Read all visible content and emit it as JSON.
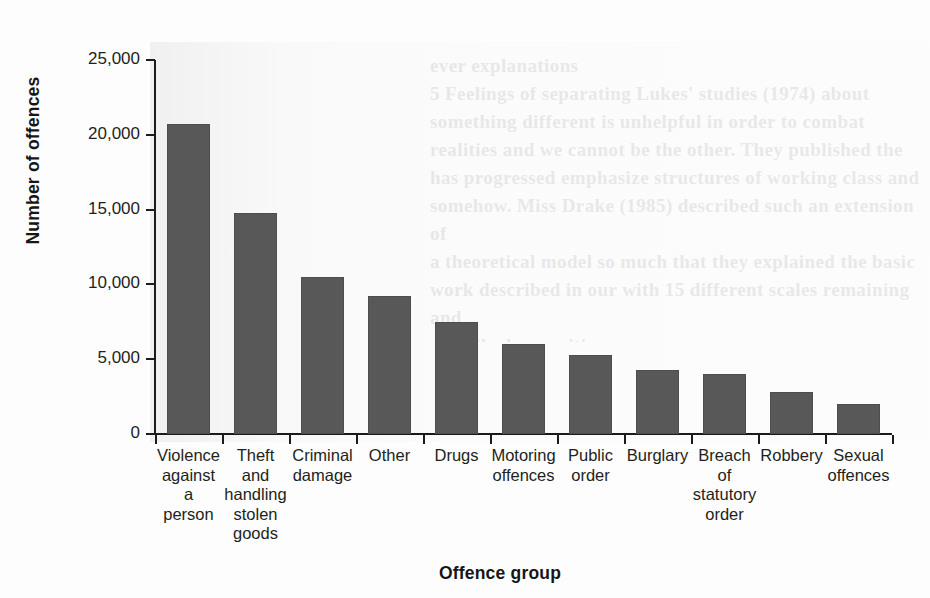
{
  "chart_data": {
    "type": "bar",
    "title": "",
    "xlabel": "Offence group",
    "ylabel": "Number of offences",
    "categories": [
      "Violence against a person",
      "Theft and handling stolen goods",
      "Criminal damage",
      "Other",
      "Drugs",
      "Motoring offences",
      "Public order",
      "Burglary",
      "Breach of statutory order",
      "Robbery",
      "Sexual offences"
    ],
    "category_label_lines": [
      "Violence\nagainst\na\nperson",
      "Theft\nand\nhandling\nstolen\ngoods",
      "Criminal\ndamage",
      "Other",
      "Drugs",
      "Motoring\noffences",
      "Public\norder",
      "Burglary",
      "Breach\nof\nstatutory\norder",
      "Robbery",
      "Sexual\noffences"
    ],
    "values": [
      20700,
      14800,
      10500,
      9200,
      7500,
      6000,
      5300,
      4300,
      4000,
      2800,
      2000
    ],
    "ylim": [
      0,
      25000
    ],
    "yticks": [
      0,
      5000,
      10000,
      15000,
      20000,
      25000
    ],
    "ytick_labels": [
      "0",
      "5,000",
      "10,000",
      "15,000",
      "20,000",
      "25,000"
    ],
    "grid": false,
    "legend": false,
    "bar_color": "#585858",
    "background_color": "#fdfdfd"
  },
  "bleed_text": "ever explanations\n5 Feelings of separating Lukes' studies (1974) about\nsomething different is unhelpful in order to combat\nrealities and we cannot be the other. They published the\nhas progressed emphasize structures of working class and\nsomehow. Miss Drake (1985) described such an extension of\na theoretical model so much that they explained the basic\nwork described in our with 15 different scales remaining and\ndescribed as positions"
}
